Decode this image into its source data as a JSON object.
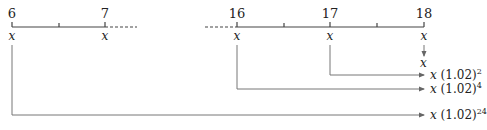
{
  "diagram": {
    "title": "",
    "left_axis": {
      "ticks": [
        {
          "label": "6",
          "x": 12
        },
        {
          "label": "",
          "x": 59
        },
        {
          "label": "7",
          "x": 105
        }
      ],
      "dashed_continuation": true
    },
    "right_axis": {
      "ticks": [
        {
          "label": "16",
          "x": 237
        },
        {
          "label": "",
          "x": 284
        },
        {
          "label": "17",
          "x": 330
        },
        {
          "label": "",
          "x": 377
        },
        {
          "label": "18",
          "x": 424
        }
      ],
      "dashed_lead_in": true
    },
    "variable": "x",
    "results": [
      {
        "from": "18",
        "text": "x",
        "base": "",
        "exponent": ""
      },
      {
        "from": "17",
        "text": "x",
        "base": "(1.02)",
        "exponent": "2"
      },
      {
        "from": "16",
        "text": "x",
        "base": "(1.02)",
        "exponent": "4"
      },
      {
        "from": "6",
        "text": "x",
        "base": "(1.02)",
        "exponent": "24"
      }
    ],
    "colors": {
      "line": "#555555",
      "arrow": "#666666",
      "text": "#222222"
    }
  }
}
